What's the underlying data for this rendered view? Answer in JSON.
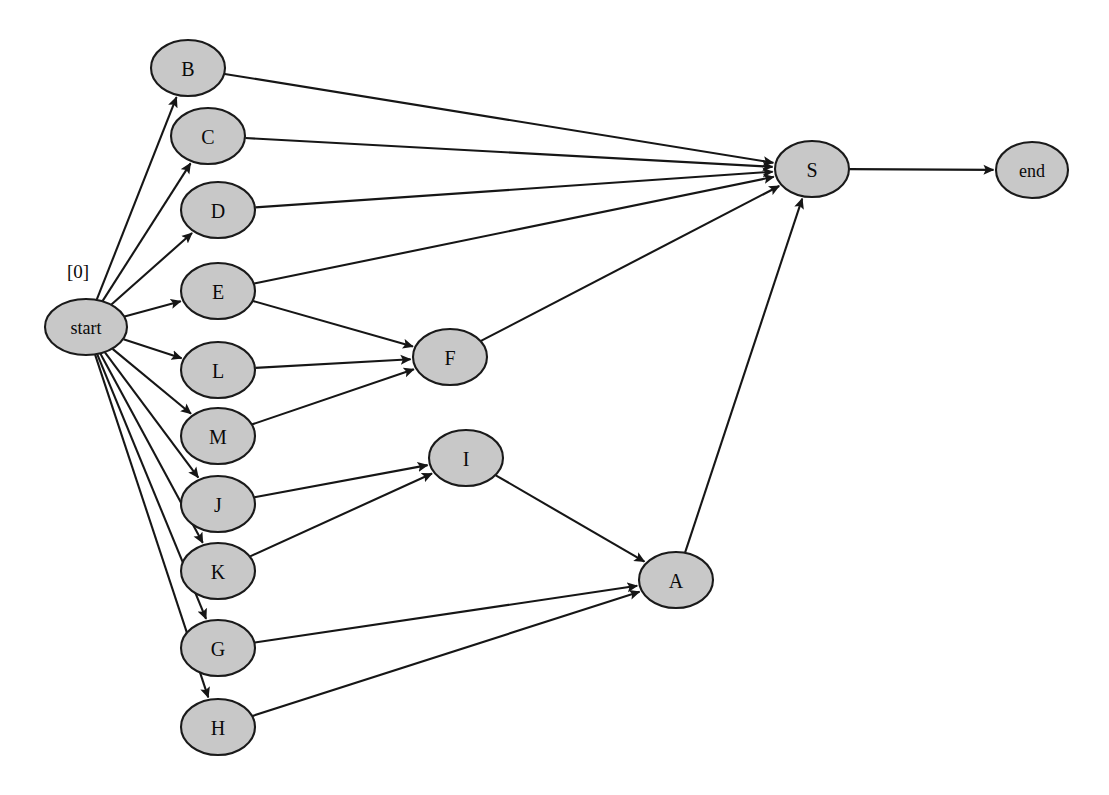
{
  "canvas": {
    "width": 1109,
    "height": 795,
    "background": "#ffffff"
  },
  "style": {
    "node_fill": "#c8c8c8",
    "node_stroke": "#1a1a1a",
    "edge_color": "#161616",
    "label_color": "#0a0a0a"
  },
  "graph": {
    "type": "directed-graph",
    "title": "",
    "node_shape": "ellipse",
    "nodes": [
      {
        "id": "start",
        "label": "start",
        "cx": 86,
        "cy": 327,
        "rx": 41,
        "ry": 28
      },
      {
        "id": "B",
        "label": "B",
        "cx": 188,
        "cy": 68,
        "rx": 37,
        "ry": 28
      },
      {
        "id": "C",
        "label": "C",
        "cx": 208,
        "cy": 136,
        "rx": 37,
        "ry": 28
      },
      {
        "id": "D",
        "label": "D",
        "cx": 218,
        "cy": 210,
        "rx": 37,
        "ry": 28
      },
      {
        "id": "E",
        "label": "E",
        "cx": 218,
        "cy": 291,
        "rx": 37,
        "ry": 28
      },
      {
        "id": "L",
        "label": "L",
        "cx": 218,
        "cy": 370,
        "rx": 37,
        "ry": 28
      },
      {
        "id": "M",
        "label": "M",
        "cx": 218,
        "cy": 436,
        "rx": 37,
        "ry": 28
      },
      {
        "id": "J",
        "label": "J",
        "cx": 218,
        "cy": 504,
        "rx": 37,
        "ry": 28
      },
      {
        "id": "K",
        "label": "K",
        "cx": 218,
        "cy": 571,
        "rx": 37,
        "ry": 28
      },
      {
        "id": "G",
        "label": "G",
        "cx": 218,
        "cy": 648,
        "rx": 37,
        "ry": 28
      },
      {
        "id": "H",
        "label": "H",
        "cx": 218,
        "cy": 727,
        "rx": 37,
        "ry": 28
      },
      {
        "id": "F",
        "label": "F",
        "cx": 450,
        "cy": 357,
        "rx": 37,
        "ry": 28
      },
      {
        "id": "I",
        "label": "I",
        "cx": 466,
        "cy": 458,
        "rx": 37,
        "ry": 28
      },
      {
        "id": "A",
        "label": "A",
        "cx": 676,
        "cy": 580,
        "rx": 37,
        "ry": 28
      },
      {
        "id": "S",
        "label": "S",
        "cx": 812,
        "cy": 169,
        "rx": 37,
        "ry": 28
      },
      {
        "id": "end",
        "label": "end",
        "cx": 1032,
        "cy": 170,
        "rx": 36,
        "ry": 28
      }
    ],
    "edges": [
      {
        "from": "start",
        "to": "B"
      },
      {
        "from": "start",
        "to": "C"
      },
      {
        "from": "start",
        "to": "D"
      },
      {
        "from": "start",
        "to": "E"
      },
      {
        "from": "start",
        "to": "L"
      },
      {
        "from": "start",
        "to": "M"
      },
      {
        "from": "start",
        "to": "J"
      },
      {
        "from": "start",
        "to": "K"
      },
      {
        "from": "start",
        "to": "G"
      },
      {
        "from": "start",
        "to": "H"
      },
      {
        "from": "B",
        "to": "S"
      },
      {
        "from": "C",
        "to": "S"
      },
      {
        "from": "D",
        "to": "S"
      },
      {
        "from": "E",
        "to": "S"
      },
      {
        "from": "E",
        "to": "F"
      },
      {
        "from": "L",
        "to": "F"
      },
      {
        "from": "M",
        "to": "F"
      },
      {
        "from": "F",
        "to": "S"
      },
      {
        "from": "J",
        "to": "I"
      },
      {
        "from": "K",
        "to": "I"
      },
      {
        "from": "I",
        "to": "A"
      },
      {
        "from": "G",
        "to": "A"
      },
      {
        "from": "H",
        "to": "A"
      },
      {
        "from": "A",
        "to": "S"
      },
      {
        "from": "S",
        "to": "end"
      }
    ],
    "annotations": [
      {
        "id": "start-cost",
        "text": "[0]",
        "x": 78,
        "y": 271,
        "attached_to": "start"
      }
    ]
  }
}
